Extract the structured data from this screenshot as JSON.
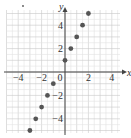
{
  "chart_data": {
    "type": "scatter",
    "title": "",
    "xlabel": "x",
    "ylabel": "y",
    "xlim": [
      -5,
      4.7
    ],
    "ylim": [
      -5.2,
      5.3
    ],
    "grid": true,
    "grid_step": 0.5,
    "x_ticks": [
      -4,
      -2,
      0,
      2,
      4
    ],
    "x_tick_labels": [
      "-4",
      "-2",
      "0",
      "2",
      "4"
    ],
    "y_ticks": [
      -4,
      -2,
      2,
      4
    ],
    "y_tick_labels": [
      "-4",
      "-2",
      "2",
      "4"
    ],
    "series": [
      {
        "name": "points",
        "x": [
          -3,
          -2.5,
          -2,
          -1.5,
          -1,
          0,
          0.5,
          1,
          1.5,
          2
        ],
        "y": [
          -5,
          -4,
          -3,
          -2,
          -1,
          1,
          2,
          3,
          4,
          5
        ]
      }
    ],
    "colors": {
      "point": "#555555",
      "grid": "#cfcfcf",
      "axis": "#444444"
    }
  }
}
